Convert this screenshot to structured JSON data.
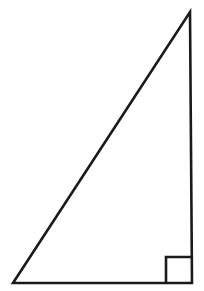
{
  "figure": {
    "name": "right-triangle",
    "background_color": "#FFFFFF",
    "stroke_color": "#1A1A1A",
    "fill_color": "none",
    "stroke_width": 2.6,
    "canvas": {
      "width": 204,
      "height": 291
    },
    "vertices": {
      "apex": {
        "x": 190,
        "y": 12
      },
      "bottom_left": {
        "x": 13,
        "y": 283
      },
      "bottom_right": {
        "x": 192,
        "y": 283
      }
    },
    "polygon_points": "13,283 192,283 190,12",
    "edges": [
      {
        "name": "base",
        "from": "bottom_left",
        "to": "bottom_right",
        "orientation": "horizontal"
      },
      {
        "name": "vertical-leg",
        "from": "bottom_right",
        "to": "apex",
        "orientation": "vertical"
      },
      {
        "name": "hypotenuse",
        "from": "apex",
        "to": "bottom_left",
        "orientation": "diagonal"
      }
    ],
    "right_angle_marker": {
      "at_vertex": "bottom_right",
      "size": 26,
      "x": 166,
      "y": 257,
      "points": "166,283 166,257 192,257"
    }
  }
}
